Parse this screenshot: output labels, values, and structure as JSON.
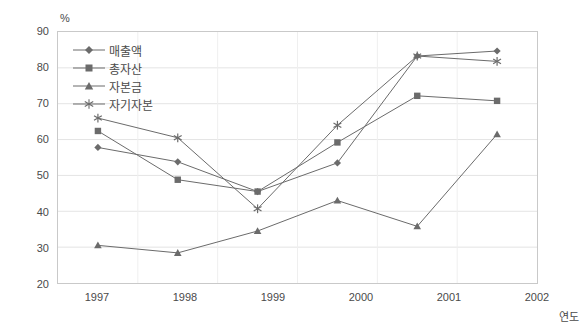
{
  "chart_data": {
    "type": "line",
    "title": "",
    "subtitle": "",
    "xlabel": "연도",
    "ylabel": "%",
    "unit_label": "%",
    "categories": [
      "1997",
      "1998",
      "1999",
      "2000",
      "2001",
      "2002"
    ],
    "ylim": [
      20,
      90
    ],
    "yticks": [
      20,
      30,
      40,
      50,
      60,
      70,
      80,
      90
    ],
    "grid": true,
    "grid_axis": "y",
    "legend_position": "top-left inside",
    "series": [
      {
        "name": "매출액",
        "marker": "diamond",
        "color": "#6b6b6b",
        "values": [
          57.8,
          53.8,
          45.5,
          53.5,
          83.3,
          84.7
        ]
      },
      {
        "name": "총자산",
        "marker": "square",
        "color": "#6b6b6b",
        "values": [
          62.4,
          48.8,
          45.5,
          59.2,
          72.2,
          70.8
        ]
      },
      {
        "name": "자본금",
        "marker": "triangle",
        "color": "#6b6b6b",
        "values": [
          30.5,
          28.4,
          34.5,
          43.0,
          35.8,
          61.5
        ]
      },
      {
        "name": "자기자본",
        "marker": "asterisk",
        "color": "#6b6b6b",
        "values": [
          66.0,
          60.5,
          40.7,
          64.0,
          83.3,
          81.8
        ]
      }
    ]
  },
  "legend": {
    "items": [
      {
        "label": "매출액"
      },
      {
        "label": "총자산"
      },
      {
        "label": "자본금"
      },
      {
        "label": "자기자본"
      }
    ]
  },
  "axis": {
    "y_tick_labels": [
      "90",
      "80",
      "70",
      "60",
      "50",
      "40",
      "30",
      "20"
    ],
    "x_tick_labels": [
      "1997",
      "1998",
      "1999",
      "2000",
      "2001",
      "2002"
    ],
    "x_axis_title": "연도",
    "y_unit": "%"
  },
  "colors": {
    "line": "#6b6b6b",
    "marker": "#6b6b6b",
    "grid": "#e4e4e4",
    "border": "#c9c9c9",
    "text": "#4a4a4a",
    "background": "#ffffff"
  }
}
